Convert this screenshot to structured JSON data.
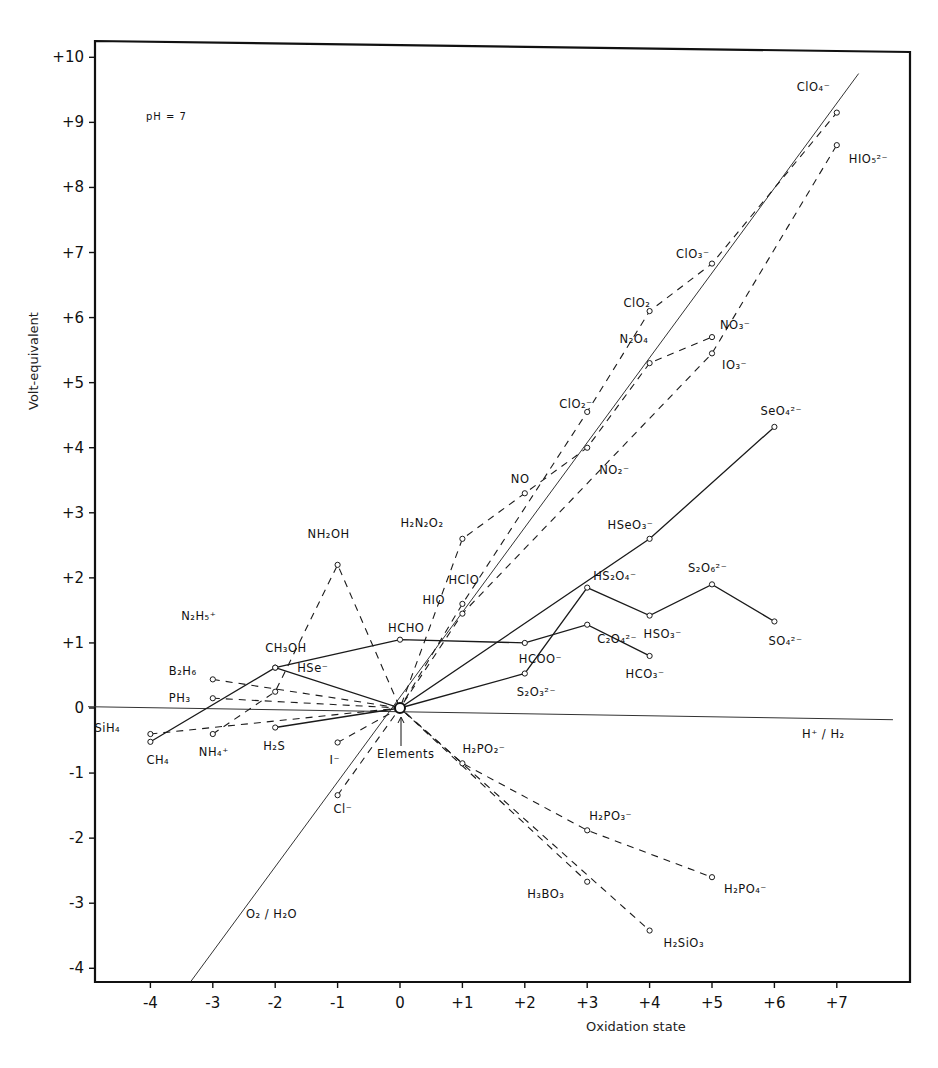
{
  "chart_data": {
    "type": "line",
    "title": "",
    "annotation": "pH = 7",
    "xlabel": "Oxidation state",
    "ylabel": "Volt-equivalent",
    "xlim": [
      -5,
      8
    ],
    "ylim": [
      -4.3,
      10.3
    ],
    "x_ticks": [
      "-4",
      "-3",
      "-2",
      "-1",
      "0",
      "+1",
      "+2",
      "+3",
      "+4",
      "+5",
      "+6",
      "+7"
    ],
    "x_tick_values": [
      -4,
      -3,
      -2,
      -1,
      0,
      1,
      2,
      3,
      4,
      5,
      6,
      7
    ],
    "y_ticks": [
      "+10",
      "+9",
      "+8",
      "+7",
      "+6",
      "+5",
      "+4",
      "+3",
      "+2",
      "+1",
      "0",
      "-1",
      "-2",
      "-3",
      "-4"
    ],
    "y_tick_values": [
      10,
      9,
      8,
      7,
      6,
      5,
      4,
      3,
      2,
      1,
      0,
      -1,
      -2,
      -3,
      -4
    ],
    "grid": false,
    "reference_lines": [
      {
        "name": "O2/H2O",
        "label": "O₂ / H₂O",
        "points": [
          [
            -3.35,
            -4.2
          ],
          [
            7.35,
            9.75
          ]
        ],
        "style": "thin"
      },
      {
        "name": "H+/H2",
        "label": "H⁺ / H₂",
        "points": [
          [
            -5.0,
            0.02
          ],
          [
            7.9,
            -0.18
          ]
        ],
        "style": "thin"
      }
    ],
    "elements_point": {
      "x": 0,
      "y": 0,
      "label": "Elements"
    },
    "series": [
      {
        "name": "Carbon",
        "style": "solid",
        "points": [
          [
            -4,
            -0.52
          ],
          [
            -2,
            0.62
          ],
          [
            0,
            1.05
          ],
          [
            2,
            1.0
          ],
          [
            3,
            1.28
          ],
          [
            4,
            0.8
          ]
        ],
        "labels": [
          "CH₄",
          "CH₃OH",
          "HCHO",
          "HCOO⁻",
          "C₂O₄²⁻",
          "HCO₃⁻"
        ]
      },
      {
        "name": "Sulfur",
        "style": "solid",
        "points": [
          [
            -2,
            -0.3
          ],
          [
            0,
            0
          ],
          [
            2,
            0.53
          ],
          [
            3,
            1.85
          ],
          [
            4,
            1.42
          ],
          [
            5,
            1.9
          ],
          [
            6,
            1.33
          ]
        ],
        "labels": [
          "H₂S",
          "",
          "S₂O₃²⁻",
          "HS₂O₄⁻",
          "HSO₃⁻",
          "S₂O₆²⁻",
          "SO₄²⁻"
        ]
      },
      {
        "name": "Selenium",
        "style": "solid",
        "points": [
          [
            -2,
            0.62
          ],
          [
            0,
            0
          ],
          [
            4,
            2.6
          ],
          [
            6,
            4.32
          ]
        ],
        "labels": [
          "HSe⁻",
          "",
          "HSeO₃⁻",
          "SeO₄²⁻"
        ]
      },
      {
        "name": "Chlorine",
        "style": "dashed",
        "points": [
          [
            -1,
            -1.34
          ],
          [
            0,
            0
          ],
          [
            1,
            1.6
          ],
          [
            3,
            4.55
          ],
          [
            4,
            6.1
          ],
          [
            5,
            6.83
          ],
          [
            7,
            9.15
          ]
        ],
        "labels": [
          "Cl⁻",
          "",
          "HClO",
          "ClO₂⁻",
          "ClO₂",
          "ClO₃⁻",
          "ClO₄⁻"
        ]
      },
      {
        "name": "Iodine",
        "style": "dashed",
        "points": [
          [
            -1,
            -0.53
          ],
          [
            0,
            0
          ],
          [
            1,
            1.45
          ],
          [
            5,
            5.45
          ],
          [
            7,
            8.65
          ]
        ],
        "labels": [
          "I⁻",
          "",
          "HIO",
          "IO₃⁻",
          "HIO₅²⁻"
        ]
      },
      {
        "name": "Nitrogen",
        "style": "dashed",
        "points": [
          [
            -3,
            -0.4
          ],
          [
            -2,
            0.25
          ],
          [
            -1,
            2.2
          ],
          [
            0,
            0
          ],
          [
            1,
            2.6
          ],
          [
            2,
            3.3
          ],
          [
            3,
            4.0
          ],
          [
            4,
            5.3
          ],
          [
            5,
            5.7
          ]
        ],
        "labels": [
          "NH₄⁺",
          "N₂H₅⁺",
          "NH₂OH",
          "",
          "H₂N₂O₂",
          "NO",
          "NO₂⁻",
          "N₂O₄",
          "NO₃⁻"
        ]
      },
      {
        "name": "Phosphorus",
        "style": "dashed",
        "points": [
          [
            -3,
            0.15
          ],
          [
            0,
            0
          ],
          [
            1,
            -0.85
          ],
          [
            3,
            -1.88
          ],
          [
            5,
            -2.6
          ]
        ],
        "labels": [
          "PH₃",
          "",
          "H₂PO₂⁻",
          "H₂PO₃⁻",
          "H₂PO₄⁻"
        ]
      },
      {
        "name": "Boron",
        "style": "dashed",
        "points": [
          [
            -3,
            0.44
          ],
          [
            0,
            0
          ],
          [
            3,
            -2.67
          ]
        ],
        "labels": [
          "B₂H₆",
          "",
          "H₃BO₃"
        ]
      },
      {
        "name": "Silicon",
        "style": "dashed",
        "points": [
          [
            -4,
            -0.4
          ],
          [
            0,
            0
          ],
          [
            4,
            -3.42
          ]
        ],
        "labels": [
          "SiH₄",
          "",
          "H₂SiO₃"
        ]
      }
    ]
  },
  "axes": {
    "xlabel": "Oxidation state",
    "ylabel": "Volt-equivalent",
    "annotation": "pH = 7"
  },
  "labels": {
    "elements": "Elements",
    "o2_h2o": "O₂ / H₂O",
    "h_h2": "H⁺ / H₂"
  },
  "caption": "Fig. 5. The vol..."
}
